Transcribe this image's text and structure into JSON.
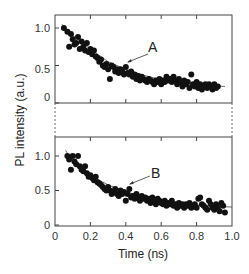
{
  "chart_data": {
    "type": "scatter",
    "title": "",
    "xlabel": "Time (ns)",
    "ylabel": "PL intensity (a.u.)",
    "xlim": [
      0,
      1.0
    ],
    "x_ticks": [
      "0",
      "0.2",
      "0.4",
      "0.6",
      "0.8",
      "1.0"
    ],
    "grid": false,
    "legend": null,
    "panels": [
      {
        "id": "top",
        "annotation": "A",
        "annotation_points_to": [
          0.41,
          0.43
        ],
        "ylim": [
          0,
          1.15
        ],
        "y_ticks": [
          "0",
          "0.5",
          "1.0"
        ],
        "fit_line": {
          "x": [
            0.04,
            0.1,
            0.2,
            0.3,
            0.4,
            0.5,
            0.6,
            0.7,
            0.8,
            0.9,
            0.96
          ],
          "y": [
            1.05,
            0.9,
            0.72,
            0.55,
            0.45,
            0.37,
            0.31,
            0.27,
            0.25,
            0.23,
            0.22
          ]
        },
        "series": [
          {
            "name": "A",
            "x": [
              0.05,
              0.07,
              0.08,
              0.09,
              0.1,
              0.11,
              0.12,
              0.13,
              0.14,
              0.15,
              0.16,
              0.17,
              0.18,
              0.19,
              0.2,
              0.21,
              0.22,
              0.23,
              0.24,
              0.25,
              0.26,
              0.27,
              0.28,
              0.29,
              0.3,
              0.31,
              0.32,
              0.33,
              0.34,
              0.35,
              0.36,
              0.37,
              0.38,
              0.39,
              0.4,
              0.41,
              0.42,
              0.43,
              0.44,
              0.45,
              0.46,
              0.47,
              0.48,
              0.49,
              0.5,
              0.51,
              0.52,
              0.53,
              0.54,
              0.55,
              0.56,
              0.57,
              0.58,
              0.59,
              0.6,
              0.61,
              0.62,
              0.63,
              0.64,
              0.65,
              0.66,
              0.67,
              0.68,
              0.69,
              0.7,
              0.71,
              0.72,
              0.73,
              0.74,
              0.75,
              0.76,
              0.77,
              0.78,
              0.79,
              0.8,
              0.81,
              0.82,
              0.83,
              0.84,
              0.85,
              0.86,
              0.87,
              0.88,
              0.89,
              0.9,
              0.91,
              0.92
            ],
            "y": [
              1.0,
              0.95,
              0.75,
              0.92,
              0.85,
              0.78,
              0.8,
              0.88,
              0.72,
              0.82,
              0.75,
              0.7,
              0.8,
              0.68,
              0.72,
              0.65,
              0.7,
              0.62,
              0.6,
              0.55,
              0.58,
              0.5,
              0.48,
              0.52,
              0.45,
              0.32,
              0.5,
              0.48,
              0.42,
              0.45,
              0.4,
              0.45,
              0.42,
              0.38,
              0.48,
              0.4,
              0.38,
              0.42,
              0.35,
              0.38,
              0.32,
              0.36,
              0.3,
              0.35,
              0.32,
              0.3,
              0.28,
              0.32,
              0.3,
              0.28,
              0.25,
              0.3,
              0.28,
              0.32,
              0.25,
              0.3,
              0.28,
              0.35,
              0.3,
              0.32,
              0.28,
              0.35,
              0.3,
              0.25,
              0.32,
              0.28,
              0.22,
              0.3,
              0.25,
              0.28,
              0.2,
              0.38,
              0.25,
              0.22,
              0.28,
              0.2,
              0.25,
              0.18,
              0.22,
              0.25,
              0.2,
              0.25,
              0.22,
              0.18,
              0.25,
              0.2,
              0.22
            ]
          }
        ]
      },
      {
        "id": "bottom",
        "annotation": "B",
        "annotation_points_to": [
          0.42,
          0.55
        ],
        "ylim": [
          0,
          1.3
        ],
        "y_ticks": [
          "0",
          "0.5",
          "1.0"
        ],
        "fit_line": {
          "x": [
            0.06,
            0.1,
            0.2,
            0.3,
            0.4,
            0.5,
            0.6,
            0.7,
            0.8,
            0.9,
            1.0
          ],
          "y": [
            1.08,
            0.92,
            0.72,
            0.58,
            0.48,
            0.41,
            0.36,
            0.32,
            0.29,
            0.27,
            0.26
          ]
        },
        "series": [
          {
            "name": "B",
            "x": [
              0.07,
              0.08,
              0.09,
              0.1,
              0.11,
              0.12,
              0.13,
              0.14,
              0.15,
              0.16,
              0.17,
              0.18,
              0.19,
              0.2,
              0.21,
              0.22,
              0.23,
              0.24,
              0.25,
              0.26,
              0.27,
              0.28,
              0.29,
              0.3,
              0.31,
              0.32,
              0.33,
              0.34,
              0.35,
              0.36,
              0.37,
              0.38,
              0.39,
              0.4,
              0.41,
              0.42,
              0.43,
              0.44,
              0.45,
              0.46,
              0.47,
              0.48,
              0.49,
              0.5,
              0.51,
              0.52,
              0.53,
              0.54,
              0.55,
              0.56,
              0.57,
              0.58,
              0.59,
              0.6,
              0.61,
              0.62,
              0.63,
              0.64,
              0.65,
              0.66,
              0.67,
              0.68,
              0.69,
              0.7,
              0.71,
              0.72,
              0.73,
              0.74,
              0.75,
              0.76,
              0.77,
              0.78,
              0.79,
              0.8,
              0.81,
              0.82,
              0.83,
              0.84,
              0.85,
              0.86,
              0.87,
              0.88,
              0.89,
              0.9,
              0.91,
              0.92,
              0.93,
              0.94,
              0.95,
              0.96
            ],
            "y": [
              1.0,
              0.95,
              0.8,
              1.0,
              0.92,
              0.88,
              1.0,
              0.85,
              0.8,
              0.78,
              0.85,
              0.75,
              0.7,
              0.72,
              0.68,
              0.65,
              0.7,
              0.62,
              0.6,
              0.58,
              0.55,
              0.52,
              0.5,
              0.55,
              0.5,
              0.45,
              0.48,
              0.52,
              0.45,
              0.42,
              0.5,
              0.45,
              0.48,
              0.35,
              0.45,
              0.52,
              0.4,
              0.42,
              0.38,
              0.45,
              0.4,
              0.35,
              0.42,
              0.38,
              0.4,
              0.35,
              0.38,
              0.32,
              0.4,
              0.35,
              0.3,
              0.38,
              0.35,
              0.32,
              0.3,
              0.35,
              0.28,
              0.32,
              0.3,
              0.35,
              0.28,
              0.3,
              0.25,
              0.32,
              0.28,
              0.3,
              0.25,
              0.3,
              0.28,
              0.32,
              0.25,
              0.28,
              0.3,
              0.25,
              0.38,
              0.4,
              0.3,
              0.28,
              0.25,
              0.22,
              0.35,
              0.3,
              0.25,
              0.22,
              0.3,
              0.25,
              0.2,
              0.32,
              0.28,
              0.18
            ]
          }
        ]
      }
    ]
  },
  "labels": {
    "y_axis": "PL intensity (a.u.)",
    "x_axis": "Time (ns)",
    "annotation_top": "A",
    "annotation_bottom": "B",
    "top_y_ticks": [
      "1.0",
      "0.5",
      "0"
    ],
    "bottom_y_ticks": [
      "1.0",
      "0.5",
      "0"
    ],
    "x_ticks": [
      "0",
      "0.2",
      "0.4",
      "0.6",
      "0.8",
      "1.0"
    ]
  },
  "colors": {
    "marker": "#111111",
    "axis": "#444444",
    "fit_line": "#444444",
    "background": "#ffffff"
  }
}
